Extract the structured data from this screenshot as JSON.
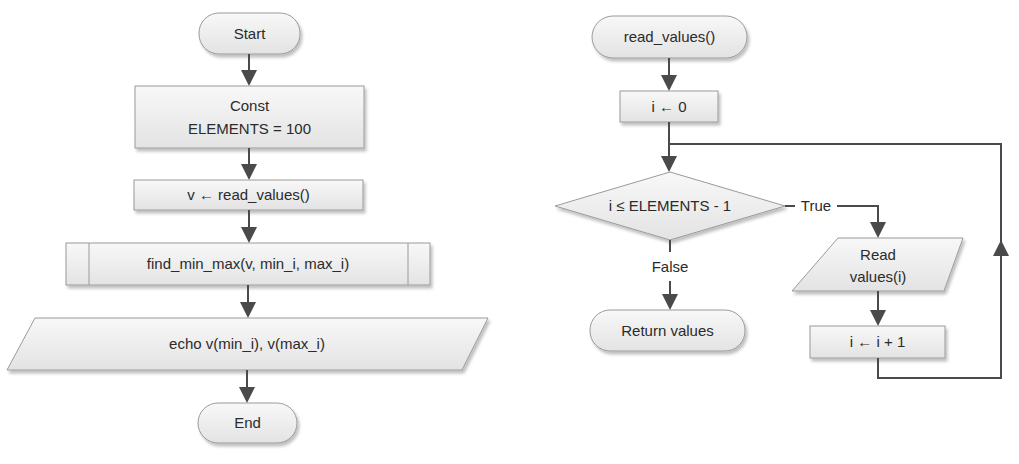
{
  "diagram": {
    "type": "flowchart",
    "colors": {
      "shape_fill_top": "#f7f7f7",
      "shape_fill_bottom": "#e4e4e4",
      "shape_border": "#9a9a9a",
      "edge": "#4a4a4a",
      "text": "#2b2b2b"
    },
    "main_flow": {
      "start": "Start",
      "const_line1": "Const",
      "const_line2": "ELEMENTS = 100",
      "assign": "v ← read_values()",
      "subroutine": "find_min_max(v, min_i, max_i)",
      "output": "echo v(min_i), v(max_i)",
      "end": "End"
    },
    "read_values_flow": {
      "start": "read_values()",
      "init": "i ← 0",
      "decision": "i ≤ ELEMENTS - 1",
      "true_label": "True",
      "false_label": "False",
      "input_line1": "Read",
      "input_line2": "values(i)",
      "increment": "i ← i + 1",
      "return": "Return values"
    }
  }
}
